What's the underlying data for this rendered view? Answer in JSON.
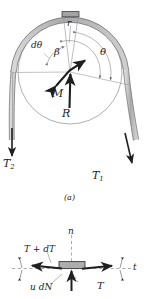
{
  "figure": {
    "title_a": "(a)",
    "colors": {
      "band_fill": "#b9b9b9",
      "band_stroke": "#4a4a4a",
      "drum_stroke": "#8a8a8a",
      "leader_stroke": "#9a9a9a",
      "arrow_dark": "#222222",
      "text": "#1b1b1b",
      "element_fill": "#a8a8a8"
    }
  },
  "diagram_a": {
    "name": "band-wrapped-drum",
    "labels": {
      "radius": "r",
      "d_theta": "dθ",
      "beta": "β",
      "theta": "θ",
      "moment": "M",
      "reaction": "R",
      "tension_slack": "T",
      "tension_slack_sub": "2",
      "tension_tight": "T",
      "tension_tight_sub": "1"
    },
    "caption": "(a)"
  },
  "diagram_b": {
    "name": "band-element-free-body",
    "labels": {
      "normal_axis": "n",
      "tangential_axis": "t",
      "tension_plus": "T + dT",
      "tension": "T",
      "friction": "u dN",
      "d_theta_half_left": "",
      "d_theta_half_right": ""
    }
  }
}
